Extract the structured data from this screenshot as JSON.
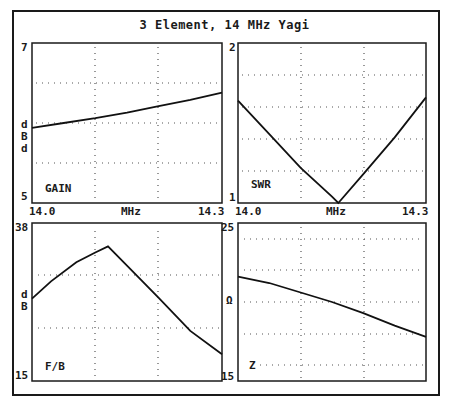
{
  "title": "3 Element, 14 MHz Yagi",
  "panels": {
    "gain": {
      "ymax": "7",
      "ymin": "5",
      "unit_chars": [
        "d",
        "B",
        "d"
      ],
      "name": "GAIN",
      "xmin": "14.0",
      "xmid": "MHz",
      "xmax": "14.3"
    },
    "swr": {
      "ymax": "2",
      "ymin": "1",
      "name": "SWR",
      "xmin": "14.0",
      "xmid": "MHz",
      "xmax": "14.3"
    },
    "fb": {
      "ymax": "38",
      "ymin": "15",
      "unit_chars": [
        "d",
        "B"
      ],
      "name": "F/B"
    },
    "z": {
      "ymax": "25",
      "ymin": "15",
      "unit_chars": [
        "Ω"
      ],
      "name": "Z"
    }
  },
  "chart_data": [
    {
      "type": "line",
      "title": "GAIN",
      "xlabel": "MHz",
      "ylabel": "dBd",
      "xlim": [
        14.0,
        14.3
      ],
      "ylim": [
        5,
        7
      ],
      "x": [
        14.0,
        14.05,
        14.1,
        14.15,
        14.2,
        14.25,
        14.3
      ],
      "values": [
        5.94,
        6.0,
        6.06,
        6.13,
        6.21,
        6.29,
        6.38
      ],
      "grid": true
    },
    {
      "type": "line",
      "title": "SWR",
      "xlabel": "MHz",
      "ylabel": "",
      "xlim": [
        14.0,
        14.3
      ],
      "ylim": [
        1,
        2
      ],
      "x": [
        14.0,
        14.05,
        14.1,
        14.15,
        14.16,
        14.2,
        14.25,
        14.3
      ],
      "values": [
        1.64,
        1.43,
        1.22,
        1.04,
        1.0,
        1.18,
        1.41,
        1.66
      ],
      "grid": true
    },
    {
      "type": "line",
      "title": "F/B",
      "xlabel": "MHz",
      "ylabel": "dB",
      "xlim": [
        14.0,
        14.3
      ],
      "ylim": [
        15,
        38
      ],
      "x": [
        14.0,
        14.03,
        14.07,
        14.1,
        14.12,
        14.15,
        14.2,
        14.25,
        14.3
      ],
      "values": [
        27.0,
        29.5,
        32.3,
        33.7,
        34.6,
        31.8,
        27.1,
        22.3,
        18.9
      ],
      "grid": true
    },
    {
      "type": "line",
      "title": "Z",
      "xlabel": "MHz",
      "ylabel": "Ω",
      "xlim": [
        14.0,
        14.3
      ],
      "ylim": [
        15,
        25
      ],
      "x": [
        14.0,
        14.05,
        14.1,
        14.15,
        14.2,
        14.25,
        14.3
      ],
      "values": [
        21.6,
        21.2,
        20.6,
        20.0,
        19.3,
        18.5,
        17.8
      ],
      "grid": true
    }
  ]
}
